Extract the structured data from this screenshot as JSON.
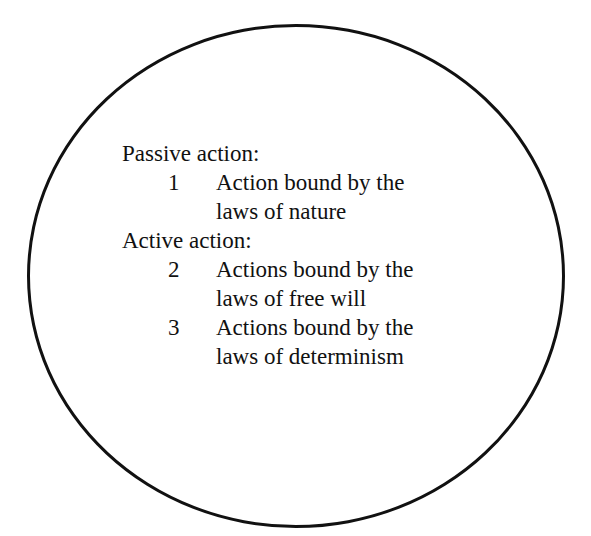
{
  "diagram": {
    "shape": "circle",
    "stroke_color": "#111111",
    "sections": [
      {
        "heading": "Passive action:",
        "items": [
          {
            "number": "1",
            "line1": "Action bound by the",
            "line2": "laws of nature"
          }
        ]
      },
      {
        "heading": "Active action:",
        "items": [
          {
            "number": "2",
            "line1": "Actions bound by the",
            "line2": "laws of free will"
          },
          {
            "number": "3",
            "line1": "Actions bound by the",
            "line2": "laws of determinism"
          }
        ]
      }
    ]
  }
}
